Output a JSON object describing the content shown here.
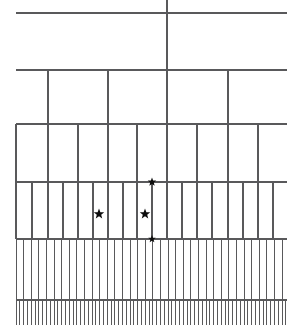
{
  "figure": {
    "orientation": "top-down",
    "width": 293,
    "height": 327,
    "background_color": "#ffffff",
    "line_color": "#59595b",
    "marker_color": "#0d0d0d"
  },
  "chart_data": {
    "type": "line",
    "subtitle": "",
    "xlabel": "",
    "ylabel": "",
    "xlim": [
      0,
      293
    ],
    "ylim": [
      327,
      0
    ],
    "grid": false,
    "legend_position": "none",
    "tick_labels": [],
    "annotations": [],
    "levels": [
      {
        "index": 0,
        "name": "root-crossbar",
        "y": 13,
        "x_start": 16,
        "x_end": 287,
        "branch_count": 1,
        "branch_x": [
          167
        ]
      },
      {
        "index": 1,
        "name": "level-1-crossbar",
        "y": 70,
        "x_start": 16,
        "x_end": 287,
        "branch_count": 4,
        "branch_x": [
          48,
          108,
          167,
          228
        ]
      },
      {
        "index": 2,
        "name": "level-2-crossbar",
        "y": 124,
        "x_start": 16,
        "x_end": 287,
        "branch_count": 9,
        "branch_x": [
          16,
          48,
          78,
          108,
          137,
          167,
          197,
          228,
          258
        ]
      },
      {
        "index": 3,
        "name": "level-3-crossbar",
        "y": 182,
        "x_start": 16,
        "x_end": 287,
        "branch_count": 18,
        "branch_x": [
          16,
          32,
          48,
          63,
          78,
          93,
          108,
          123,
          137,
          152,
          167,
          182,
          197,
          212,
          228,
          243,
          258,
          273
        ]
      },
      {
        "index": 4,
        "name": "level-4-crossbar",
        "y": 239,
        "x_start": 16,
        "x_end": 287,
        "branch_count": 36,
        "branch_spacing": 7.6
      },
      {
        "index": 5,
        "name": "leaf-crossbar",
        "y": 300,
        "x_start": 16,
        "x_end": 287,
        "branch_count": 72,
        "branch_spacing": 3.8,
        "leaf_bottom_y": 325
      }
    ],
    "root_stem": {
      "x": 167,
      "y_top": 0,
      "y_bottom": 13
    },
    "markers": [
      {
        "id": 1,
        "shape": "star",
        "x": 99,
        "y": 214,
        "size": 11
      },
      {
        "id": 2,
        "shape": "star",
        "x": 152,
        "y": 182,
        "size": 9
      },
      {
        "id": 3,
        "shape": "star",
        "x": 145,
        "y": 214,
        "size": 11
      },
      {
        "id": 4,
        "shape": "star",
        "x": 152,
        "y": 239,
        "size": 8
      }
    ]
  }
}
